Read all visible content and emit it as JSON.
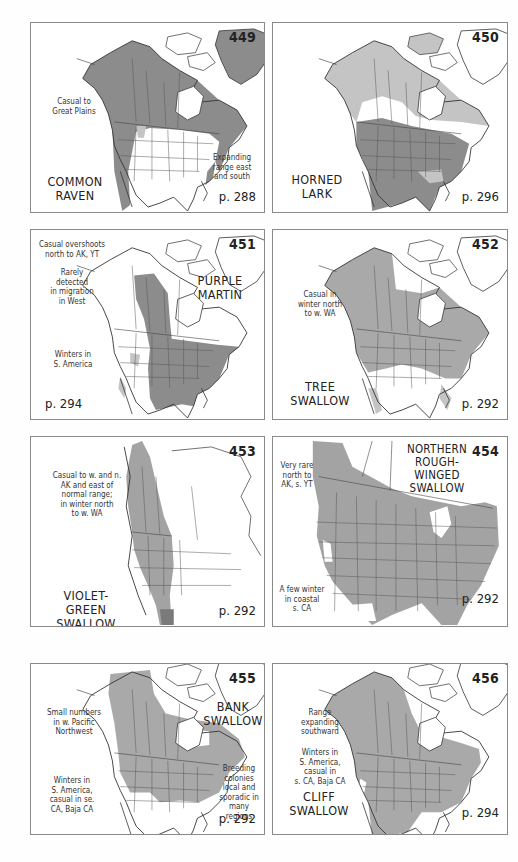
{
  "colors": {
    "range_dark": "#8c8c8c",
    "range_light": "#c4c4c4",
    "border": "#8a8a8a",
    "text": "#222222"
  },
  "maps": [
    {
      "number": "449",
      "species": [
        "COMMON",
        "RAVEN"
      ],
      "notes": [
        [
          "Casual to",
          "Great Plains"
        ],
        [
          "Expanding",
          "range east",
          "and south"
        ]
      ],
      "page_ref": "p. 288"
    },
    {
      "number": "450",
      "species": [
        "HORNED",
        "LARK"
      ],
      "notes": [],
      "page_ref": "p. 296"
    },
    {
      "number": "451",
      "species": [
        "PURPLE",
        "MARTIN"
      ],
      "notes": [
        [
          "Casual overshoots",
          "north to AK, YT"
        ],
        [
          "Rarely",
          "detected",
          "in migration",
          "in West"
        ],
        [
          "Winters in",
          "S. America"
        ]
      ],
      "page_ref": "p. 294"
    },
    {
      "number": "452",
      "species": [
        "TREE",
        "SWALLOW"
      ],
      "notes": [
        [
          "Casual in",
          "winter north",
          "to w. WA"
        ]
      ],
      "page_ref": "p. 292"
    },
    {
      "number": "453",
      "species": [
        "VIOLET-GREEN",
        "SWALLOW"
      ],
      "notes": [
        [
          "Casual to w. and n.",
          "AK and east of",
          "normal range;",
          "in winter north",
          "to w. WA"
        ]
      ],
      "page_ref": "p. 292"
    },
    {
      "number": "454",
      "species": [
        "NORTHERN",
        "ROUGH-WINGED",
        "SWALLOW"
      ],
      "notes": [
        [
          "Very rare",
          "north to",
          "AK, s. YT"
        ],
        [
          "A few winter",
          "in coastal",
          "s. CA"
        ]
      ],
      "page_ref": "p. 292"
    },
    {
      "number": "455",
      "species": [
        "BANK",
        "SWALLOW"
      ],
      "notes": [
        [
          "Small numbers",
          "in w. Pacific",
          "Northwest"
        ],
        [
          "Winters in",
          "S. America,",
          "casual in se.",
          "CA, Baja CA"
        ],
        [
          "Breeding",
          "colonies",
          "local and",
          "sporadic in",
          "many regions"
        ]
      ],
      "page_ref": "p. 292"
    },
    {
      "number": "456",
      "species": [
        "CLIFF",
        "SWALLOW"
      ],
      "notes": [
        [
          "Range",
          "expanding",
          "southward"
        ],
        [
          "Winters in",
          "S. America,",
          "casual in",
          "s. CA, Baja CA"
        ]
      ],
      "page_ref": "p. 294"
    }
  ]
}
